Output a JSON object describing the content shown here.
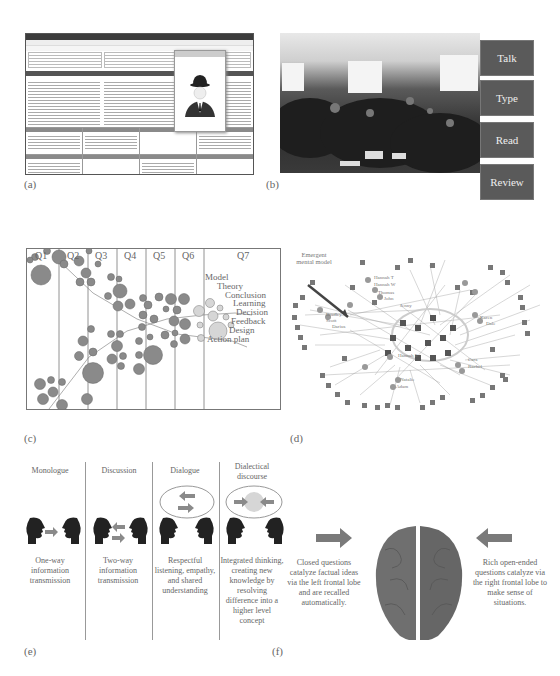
{
  "panels": {
    "a": {
      "label": "(a)",
      "description": "Software window screenshot with text panes, toolbar and popup image of a man in a bowler hat"
    },
    "b": {
      "label": "(b)",
      "description": "Photograph of large room of participants at tables",
      "steps": [
        "Talk",
        "Type",
        "Read",
        "Review"
      ]
    },
    "c": {
      "label": "(c)",
      "columns": [
        "Q1",
        "Q2",
        "Q3",
        "Q4",
        "Q5",
        "Q6",
        "Q7"
      ],
      "outcomes": [
        "Model",
        "Theory",
        "Conclusion",
        "Learning",
        "Decision",
        "Feedback",
        "Design",
        "Action plan"
      ]
    },
    "d": {
      "label": "(d)",
      "annotation": "Emergent mental model",
      "node_names": [
        "Hannah T",
        "Hannah W",
        "Thomas",
        "John",
        "Jenny",
        "Bradley",
        "Scott",
        "Darius",
        "Karen",
        "Dale",
        "Hannah E",
        "Cara",
        "Rachel",
        "Natalie",
        "Adam"
      ],
      "node_numbers": [
        "11",
        "14",
        "19",
        "34",
        "32",
        "52",
        "27",
        "15",
        "30",
        "43",
        "31",
        "28",
        "26",
        "34",
        "35",
        "29",
        "18",
        "3",
        "37",
        "40",
        "42",
        "50",
        "33",
        "46",
        "17"
      ]
    },
    "e": {
      "label": "(e)",
      "modes": [
        {
          "title": "Monologue",
          "text": "One-way information transmission"
        },
        {
          "title": "Discussion",
          "text": "Two-way information transmission"
        },
        {
          "title": "Dialogue",
          "text": "Respectful listening, empathy, and shared understanding"
        },
        {
          "title": "Dialectical discourse",
          "text": "Integrated thinking, creating new knowledge by resolving difference into a higher level concept"
        }
      ]
    },
    "f": {
      "label": "(f)",
      "left_text": "Closed questions catalyze factual ideas via the left frontal lobe and are recalled automatically.",
      "right_text": "Rich open-ended questions catalyze via the right frontal lobe to make sense of situations."
    }
  },
  "colors": {
    "bubble": "#8a8a8a",
    "bubble_light": "#d6d6d6",
    "arrow": "#7a7a7a",
    "text": "#666666"
  }
}
